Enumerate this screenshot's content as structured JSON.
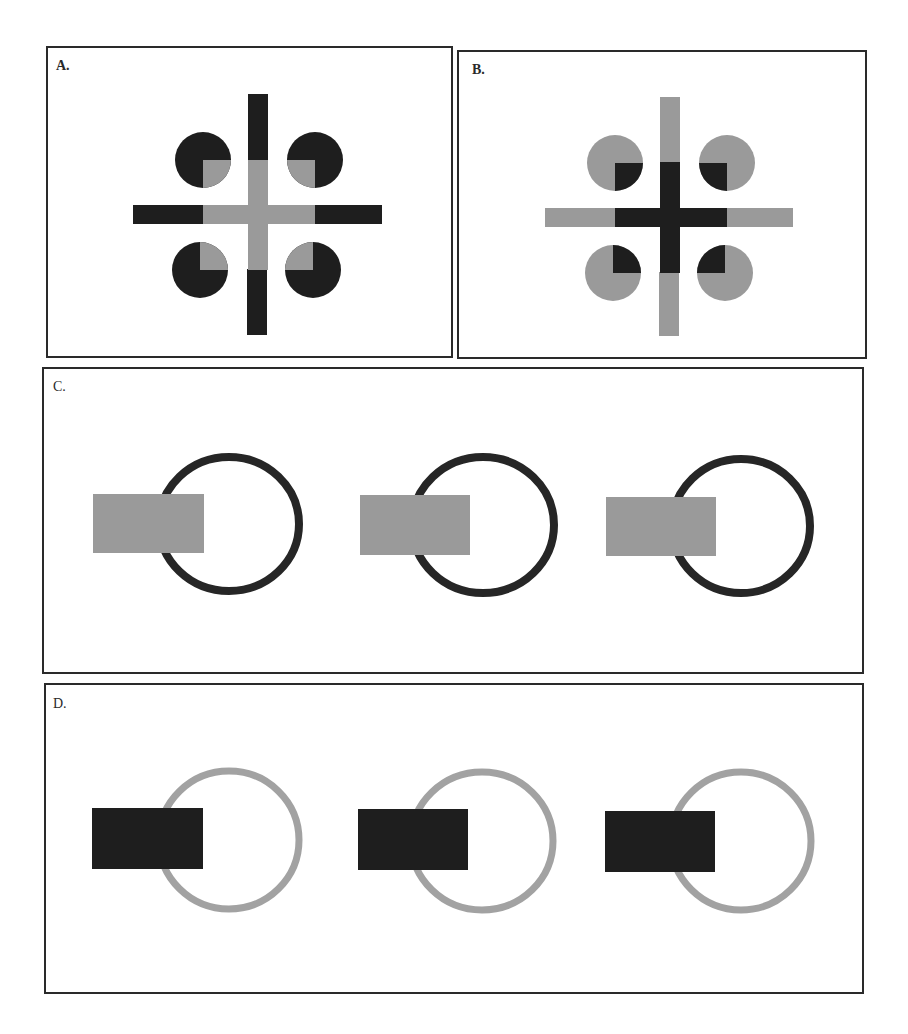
{
  "figure": {
    "colors": {
      "dark": "#1e1e1e",
      "gray": "#9a9a9a",
      "ring_dark": "#262626",
      "ring_gray": "#a2a2a2",
      "border": "#2a2a2a",
      "background": "#ffffff"
    },
    "panels": [
      {
        "id": "A",
        "label": "A.",
        "description": "Cross with dark arm ends and gray center; four dark disks with gray inner quarter-notches"
      },
      {
        "id": "B",
        "label": "B.",
        "description": "Cross with gray arm ends and dark center; four gray disks with dark inner quarter-notches"
      },
      {
        "id": "C",
        "label": "C.",
        "description": "Three dark rings, each partially occluded on the left by a gray rectangle"
      },
      {
        "id": "D",
        "label": "D.",
        "description": "Three gray rings, each partially occluded on the left by a dark rectangle"
      }
    ]
  }
}
